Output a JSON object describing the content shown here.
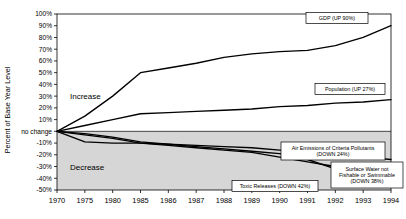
{
  "chart_data": {
    "type": "line",
    "title": "",
    "xlabel": "",
    "ylabel": "Percent of Base Year Level",
    "x": [
      1970,
      1975,
      1980,
      1985,
      1986,
      1987,
      1988,
      1989,
      1990,
      1991,
      1992,
      1993,
      1994
    ],
    "xtick_labels": [
      "1970",
      "1975",
      "1980",
      "1985",
      "1986",
      "1987",
      "1988",
      "1989",
      "1990",
      "1991",
      "1992",
      "1993",
      "1994"
    ],
    "ytick_labels": [
      "100%",
      "90%",
      "80%",
      "70%",
      "60%",
      "50%",
      "40%",
      "30%",
      "20%",
      "10%",
      "no change",
      "-10%",
      "-20%",
      "-30%",
      "-40%",
      "-50%"
    ],
    "ytick_values": [
      100,
      90,
      80,
      70,
      60,
      50,
      40,
      30,
      20,
      10,
      0,
      -10,
      -20,
      -30,
      -40,
      -50
    ],
    "ylim": [
      -50,
      100
    ],
    "grid": false,
    "legend_position": "inline-callouts",
    "zone_labels": [
      {
        "text": "Increase",
        "value": 30
      },
      {
        "text": "Decrease",
        "value": -30
      }
    ],
    "shaded_region": {
      "from": -50,
      "to": 0,
      "color": "#d6d6d6"
    },
    "series": [
      {
        "name": "GDP (UP 90%)",
        "label": "GDP (UP 90%)",
        "values": [
          0,
          13,
          30,
          50,
          54,
          58,
          63,
          66,
          68,
          69,
          73,
          80,
          90
        ]
      },
      {
        "name": "Population (UP 27%)",
        "label": "Population (UP 27%)",
        "values": [
          0,
          5,
          10,
          15,
          16,
          17,
          18,
          19,
          21,
          22,
          24,
          25,
          27
        ]
      },
      {
        "name": "Air Emissions of Criteria Pollutants (DOWN 24%)",
        "label": "Air Emissions of Criteria Pollutants (DOWN 24%)",
        "values": [
          0,
          -3,
          -6,
          -10,
          -11,
          -12,
          -13,
          -14,
          -16,
          -18,
          -20,
          -22,
          -24
        ]
      },
      {
        "name": "Surface Water not Fishable or Swimmable (DOWN 38%)",
        "label": "Surface Water not Fishable or Swimmable (DOWN 38%)",
        "values": [
          0,
          -9,
          -10,
          -10,
          -12,
          -14,
          -16,
          -18,
          -22,
          -26,
          -30,
          -34,
          -38
        ]
      },
      {
        "name": "Toxic Releases (DOWN 42%)",
        "label": "Toxic Releases (DOWN 42%)",
        "values": [
          0,
          -2,
          -5,
          -9,
          -11,
          -13,
          -15,
          -17,
          -19,
          -24,
          -32,
          -38,
          -42
        ]
      }
    ],
    "callouts": [
      {
        "label": "GDP (UP 90%)",
        "lines": [
          "GDP (UP 90%)"
        ]
      },
      {
        "label": "Population (UP 27%)",
        "lines": [
          "Population (UP 27%)"
        ]
      },
      {
        "label": "Air Emissions of Criteria Pollutants (DOWN 24%)",
        "lines": [
          "Air Emissions of Criteria Pollutants",
          "(DOWN 24%)"
        ]
      },
      {
        "label": "Surface Water not Fishable or Swimmable (DOWN 38%)",
        "lines": [
          "Surface Water not",
          "Fishable or Swimmable",
          "(DOWN 38%)"
        ]
      },
      {
        "label": "Toxic Releases (DOWN 42%)",
        "lines": [
          "Toxic Releases (DOWN 42%)"
        ]
      }
    ],
    "colors": {
      "line": "#000000",
      "shade": "#d6d6d6",
      "frame": "#000000",
      "background": "#ffffff"
    }
  }
}
